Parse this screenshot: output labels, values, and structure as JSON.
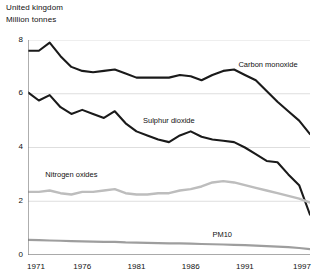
{
  "header": {
    "title": "United kingdom",
    "subtitle": "Million tonnes"
  },
  "chart_data": {
    "type": "line",
    "title": "United kingdom",
    "subtitle": "Million tonnes",
    "xlabel": "",
    "ylabel": "Million tonnes",
    "xlim": [
      1971,
      1997
    ],
    "ylim": [
      0,
      8
    ],
    "yticks": [
      0,
      2,
      4,
      6,
      8
    ],
    "xticks": [
      1971,
      1976,
      1981,
      1986,
      1991,
      1997
    ],
    "grid": "horizontal",
    "legend": "inline-labels",
    "x": [
      1971,
      1972,
      1973,
      1974,
      1975,
      1976,
      1977,
      1978,
      1979,
      1980,
      1981,
      1982,
      1983,
      1984,
      1985,
      1986,
      1987,
      1988,
      1989,
      1990,
      1991,
      1992,
      1993,
      1994,
      1995,
      1996,
      1997
    ],
    "series": [
      {
        "name": "Carbon monoxide",
        "color": "#1a1a1a",
        "width": 2.1,
        "label_x": 1990.4,
        "label_y": 7.05,
        "values": [
          7.6,
          7.6,
          7.9,
          7.4,
          7.0,
          6.85,
          6.8,
          6.85,
          6.9,
          6.75,
          6.6,
          6.6,
          6.6,
          6.6,
          6.7,
          6.65,
          6.5,
          6.7,
          6.85,
          6.9,
          6.7,
          6.5,
          6.1,
          5.7,
          5.35,
          5.0,
          4.5
        ]
      },
      {
        "name": "Sulphur dioxide",
        "color": "#1a1a1a",
        "width": 2.1,
        "label_x": 1981.6,
        "label_y": 4.95,
        "values": [
          6.05,
          5.75,
          5.95,
          5.5,
          5.25,
          5.4,
          5.25,
          5.1,
          5.35,
          4.9,
          4.6,
          4.45,
          4.3,
          4.2,
          4.45,
          4.6,
          4.4,
          4.3,
          4.25,
          4.2,
          4.0,
          3.75,
          3.5,
          3.45,
          3.0,
          2.6,
          1.5
        ]
      },
      {
        "name": "Nitrogen oxides",
        "color": "#bdbdbd",
        "width": 2.4,
        "label_x": 1972.6,
        "label_y": 2.95,
        "values": [
          2.35,
          2.35,
          2.4,
          2.3,
          2.25,
          2.35,
          2.35,
          2.4,
          2.45,
          2.3,
          2.25,
          2.25,
          2.3,
          2.3,
          2.4,
          2.45,
          2.55,
          2.7,
          2.75,
          2.7,
          2.6,
          2.5,
          2.4,
          2.3,
          2.2,
          2.1,
          1.95
        ]
      },
      {
        "name": "PM10",
        "color": "#9e9e9e",
        "width": 2.2,
        "label_x": 1988.0,
        "label_y": 0.72,
        "values": [
          0.56,
          0.55,
          0.54,
          0.53,
          0.52,
          0.51,
          0.5,
          0.49,
          0.49,
          0.47,
          0.46,
          0.45,
          0.44,
          0.43,
          0.43,
          0.42,
          0.41,
          0.4,
          0.39,
          0.38,
          0.37,
          0.35,
          0.33,
          0.31,
          0.29,
          0.26,
          0.22
        ]
      }
    ]
  }
}
